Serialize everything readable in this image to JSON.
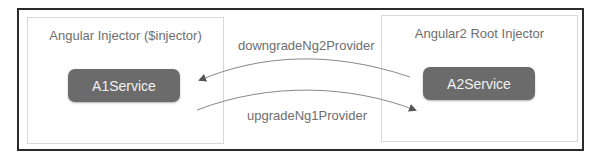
{
  "left_injector": {
    "title": "Angular Injector ($injector)",
    "service": "A1Service"
  },
  "right_injector": {
    "title": "Angular2 Root Injector",
    "service": "A2Service"
  },
  "arrows": {
    "downgrade_label": "downgradeNg2Provider",
    "upgrade_label": "upgradeNg1Provider"
  },
  "colors": {
    "service_fill": "#6b6b6b",
    "service_text": "#f2f2f2",
    "frame_border": "#2b2b2b",
    "box_border": "#d8d8d8",
    "label_text": "#6e6e6e"
  }
}
